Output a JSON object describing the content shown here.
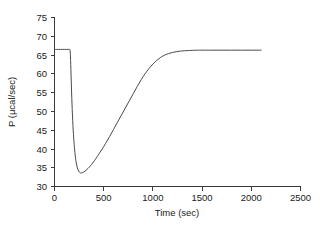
{
  "chart_data": {
    "type": "line",
    "title": "",
    "subtitle": "",
    "xlabel": "Time (sec)",
    "ylabel": "P (μcal/sec)",
    "xlim": [
      0,
      2500
    ],
    "ylim": [
      30,
      75
    ],
    "xticks": [
      0,
      500,
      1000,
      1500,
      2000,
      2500
    ],
    "xtick_labels": [
      "0",
      "500",
      "1000",
      "1500",
      "2000",
      "2500"
    ],
    "yticks": [
      30,
      35,
      40,
      45,
      50,
      55,
      60,
      65,
      70,
      75
    ],
    "ytick_labels": [
      "30",
      "35",
      "40",
      "45",
      "50",
      "55",
      "60",
      "65",
      "70",
      "75"
    ],
    "grid": false,
    "legend": null,
    "legend_position": "none",
    "annotations": [],
    "series": [
      {
        "name": "power",
        "color": "#4a4a4a",
        "linewidth": 1,
        "x": [
          0,
          20,
          40,
          60,
          80,
          100,
          120,
          140,
          155,
          160,
          165,
          172,
          180,
          190,
          200,
          210,
          220,
          232,
          245,
          258,
          270,
          285,
          300,
          320,
          340,
          365,
          390,
          420,
          450,
          485,
          520,
          560,
          600,
          640,
          680,
          720,
          760,
          800,
          840,
          880,
          920,
          960,
          1000,
          1040,
          1080,
          1120,
          1160,
          1200,
          1240,
          1280,
          1320,
          1360,
          1400,
          1450,
          1500,
          1600,
          1700,
          1800,
          1900,
          2000,
          2100
        ],
        "y": [
          66.5,
          66.5,
          66.5,
          66.5,
          66.5,
          66.5,
          66.5,
          66.5,
          66.5,
          65.8,
          62.5,
          56.5,
          50.5,
          45.0,
          41.2,
          38.4,
          36.5,
          35.0,
          34.1,
          33.7,
          33.6,
          33.7,
          33.9,
          34.3,
          34.8,
          35.5,
          36.3,
          37.4,
          38.6,
          40.0,
          41.5,
          43.3,
          45.2,
          47.1,
          49.0,
          50.9,
          52.8,
          54.7,
          56.6,
          58.4,
          60.0,
          61.4,
          62.6,
          63.6,
          64.4,
          65.0,
          65.4,
          65.7,
          65.9,
          66.05,
          66.15,
          66.2,
          66.25,
          66.3,
          66.3,
          66.3,
          66.3,
          66.3,
          66.3,
          66.3,
          66.3
        ]
      }
    ],
    "description_points": {
      "initial_baseline": 66.5,
      "injection_time": 160,
      "minimum_value": 33.6,
      "minimum_time": 270,
      "final_baseline": 66.3,
      "curve_end_time": 2100
    }
  },
  "axes": {
    "x_axis_name": "time-axis",
    "y_axis_name": "power-axis"
  }
}
